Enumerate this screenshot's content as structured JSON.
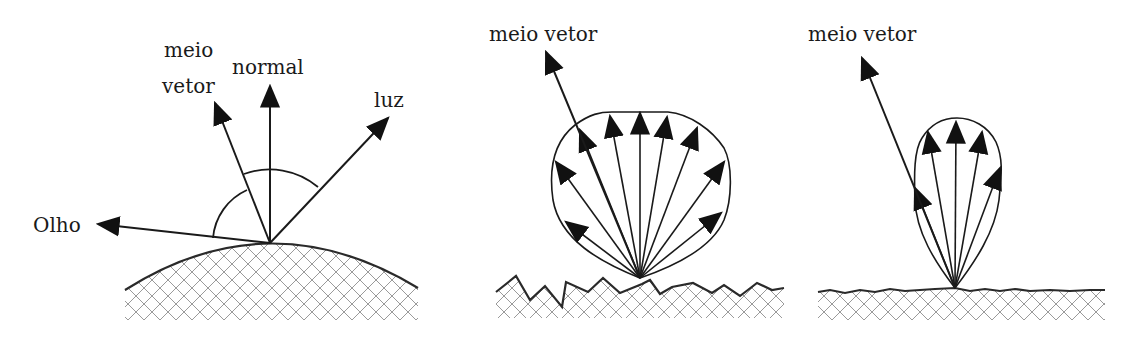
{
  "figures": [
    {
      "id": "geometry",
      "labels": {
        "half_vector_line1": "meio",
        "half_vector_line2": "vetor",
        "normal": "normal",
        "light": "luz",
        "eye": "Olho"
      },
      "origin": [
        270,
        243
      ],
      "vectors": {
        "eye": [
          98,
          224
        ],
        "half_vector": [
          215,
          103
        ],
        "normal": [
          270,
          86
        ],
        "light": [
          388,
          118
        ]
      },
      "surface": "curved"
    },
    {
      "id": "rough-surface-lobe",
      "labels": {
        "half_vector": "meio vetor"
      },
      "origin": [
        640,
        278
      ],
      "half_vector_tip": [
        546,
        52
      ],
      "lobe_arrow_tips": [
        [
          565,
          222
        ],
        [
          555,
          160
        ],
        [
          578,
          130
        ],
        [
          610,
          117
        ],
        [
          640,
          112
        ],
        [
          667,
          117
        ],
        [
          697,
          130
        ],
        [
          724,
          165
        ],
        [
          720,
          213
        ]
      ],
      "surface": "jagged"
    },
    {
      "id": "smooth-surface-lobe",
      "labels": {
        "half_vector": "meio vetor"
      },
      "origin": [
        955,
        288
      ],
      "half_vector_tip": [
        862,
        58
      ],
      "lobe_arrow_tips": [
        [
          914,
          190
        ],
        [
          927,
          132
        ],
        [
          956,
          122
        ],
        [
          982,
          132
        ],
        [
          1000,
          168
        ]
      ],
      "surface": "nearly-flat"
    }
  ],
  "colors": {
    "ink": "#1a1a1a",
    "hatch": "#9a9a9a",
    "background": "#ffffff"
  }
}
